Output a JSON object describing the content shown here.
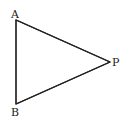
{
  "diagram": {
    "type": "triangle",
    "stroke_color": "#222222",
    "background": "#ffffff",
    "vertices": [
      {
        "label": "A",
        "x": 16,
        "y": 20
      },
      {
        "label": "B",
        "x": 16,
        "y": 104
      },
      {
        "label": "P",
        "x": 110,
        "y": 62
      }
    ],
    "labels": {
      "a": "A",
      "b": "B",
      "p": "P"
    }
  }
}
